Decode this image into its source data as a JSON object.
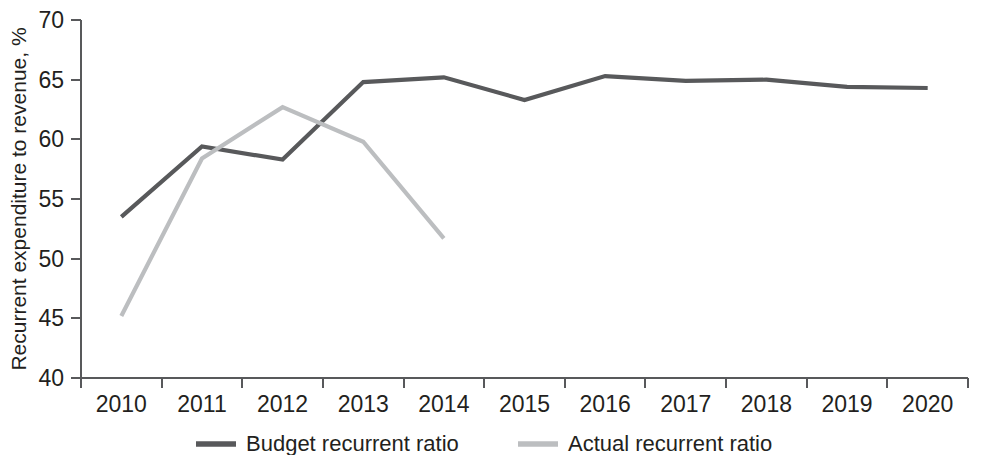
{
  "chart_data": {
    "type": "line",
    "title": "",
    "subtitle": "",
    "xlabel": "",
    "ylabel": "Recurrent expenditure to revenue, %",
    "x": [
      2010,
      2011,
      2012,
      2013,
      2014,
      2015,
      2016,
      2017,
      2018,
      2019,
      2020
    ],
    "categories": [
      "2010",
      "2011",
      "2012",
      "2013",
      "2014",
      "2015",
      "2016",
      "2017",
      "2018",
      "2019",
      "2020"
    ],
    "xlim": [
      2009.5,
      2020.5
    ],
    "ylim": [
      40,
      70
    ],
    "y_ticks": [
      40,
      45,
      50,
      55,
      60,
      65,
      70
    ],
    "y_tick_labels": [
      "40",
      "45",
      "50",
      "55",
      "60",
      "65",
      "70"
    ],
    "grid": false,
    "legend_position": "bottom-center",
    "series": [
      {
        "name": "Budget recurrent ratio",
        "color": "#58595b",
        "values": [
          53.5,
          59.4,
          58.3,
          64.8,
          65.2,
          63.3,
          65.3,
          64.9,
          65.0,
          64.4,
          64.3
        ]
      },
      {
        "name": "Actual recurrent ratio",
        "color": "#bcbec0",
        "values": [
          45.2,
          58.4,
          62.7,
          59.8,
          51.7,
          null,
          null,
          null,
          null,
          null,
          null
        ]
      }
    ],
    "annotations": []
  },
  "legend": {
    "items": [
      {
        "label": "Budget recurrent ratio",
        "color": "#58595b"
      },
      {
        "label": "Actual recurrent ratio",
        "color": "#bcbec0"
      }
    ]
  },
  "axis": {
    "y_title": "Recurrent expenditure to revenue, %"
  }
}
